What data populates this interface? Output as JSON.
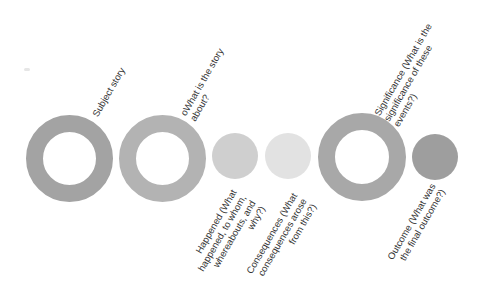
{
  "diagram": {
    "nodes": [
      {
        "id": "subject",
        "shape": "ring",
        "color": "#a3a3a3",
        "label": "Subject story",
        "label_position": "top"
      },
      {
        "id": "about",
        "shape": "ring",
        "color": "#b3b3b3",
        "label": "oWhat is the story\nabout?",
        "label_position": "top"
      },
      {
        "id": "happened",
        "shape": "disc",
        "color": "#cfcfcf",
        "label": "Happened (What\nhappened, to whom,\nwhereabouts, and\nwhy?)",
        "label_position": "bottom"
      },
      {
        "id": "consequences",
        "shape": "disc",
        "color": "#e2e2e2",
        "label": "Consequences (What\nconsequences arose\nfrom this?)",
        "label_position": "bottom"
      },
      {
        "id": "significance",
        "shape": "ring",
        "color": "#a8a8a8",
        "label": "Significance (What is the\nsignificance of these\nevents?)",
        "label_position": "top"
      },
      {
        "id": "outcome",
        "shape": "disc",
        "color": "#9e9e9e",
        "label": "Outcome (What was\nthe final outcome?)",
        "label_position": "bottom"
      }
    ]
  }
}
